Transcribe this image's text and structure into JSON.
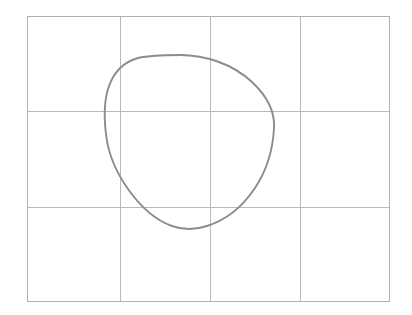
{
  "figure": {
    "kind": "line-diagram",
    "background_color": "#ffffff",
    "width": 412,
    "height": 315
  },
  "grid": {
    "name": "background-grid",
    "border_color": "#b0b0b0",
    "line_color": "#b9b9b9",
    "line_width": 1,
    "bounds": {
      "x0": 27,
      "y0": 16,
      "x1": 390,
      "y1": 302
    },
    "columns": 4,
    "rows": 3,
    "vertical_lines_x": [
      120,
      210,
      300
    ],
    "horizontal_lines_y": [
      111,
      207
    ]
  },
  "curve": {
    "name": "closed-blob-curve",
    "stroke_color": "#8c8c8c",
    "stroke_width": 1.9,
    "closed": true,
    "extremes": {
      "top": {
        "x": 180,
        "y": 55
      },
      "right": {
        "x": 274,
        "y": 128
      },
      "bottom": {
        "x": 190,
        "y": 228
      },
      "left": {
        "x": 106,
        "y": 122
      }
    },
    "path": "M 180 55 C 205 55 233 64 252 82 C 268 97 275 112 274 128 C 273 148 267 170 255 188 C 243 206 226 220 207 226 C 195 230 183 230 172 226 C 155 220 140 206 128 189 C 116 172 108 153 106 134 C 104 118 104 100 109 86 C 114 72 124 62 138 58 C 151 55 166 55 180 55 Z"
  },
  "annotations": {
    "title": "",
    "labels": []
  }
}
